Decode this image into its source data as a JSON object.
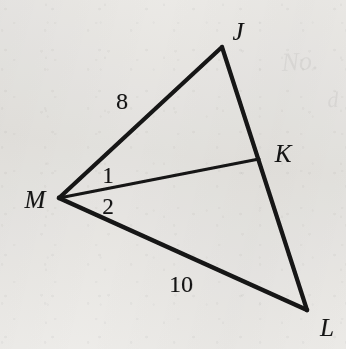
{
  "figure": {
    "background_color": "#f3f2f0",
    "ink_color": "#141414",
    "canvas": {
      "width": 346,
      "height": 349
    },
    "vertices": [
      {
        "id": "J",
        "label": "J",
        "point": [
          222,
          47
        ],
        "label_pos": [
          238,
          31
        ]
      },
      {
        "id": "M",
        "label": "M",
        "point": [
          59,
          198
        ],
        "label_pos": [
          35,
          199
        ]
      },
      {
        "id": "K",
        "label": "K",
        "point": [
          259,
          159
        ],
        "label_pos": [
          283,
          153
        ]
      },
      {
        "id": "L",
        "label": "L",
        "point": [
          307,
          310
        ],
        "label_pos": [
          327,
          327
        ]
      }
    ],
    "segments": [
      {
        "id": "MJ",
        "from": "M",
        "to": "J",
        "stroke_width": 4.2
      },
      {
        "id": "JL",
        "from": "J",
        "to": "L",
        "stroke_width": 4.2
      },
      {
        "id": "ML",
        "from": "M",
        "to": "L",
        "stroke_width": 4.6
      },
      {
        "id": "MK",
        "from": "M",
        "to": "K",
        "stroke_width": 3.0
      }
    ],
    "measure_labels": [
      {
        "id": "MJ-length",
        "text": "8",
        "pos": [
          122,
          101
        ],
        "on_segment": "MJ"
      },
      {
        "id": "ML-length",
        "text": "10",
        "pos": [
          181,
          284
        ],
        "on_segment": "ML"
      }
    ],
    "angle_labels": [
      {
        "id": "angle-1",
        "text": "1",
        "pos": [
          108,
          175
        ],
        "at_vertex": "M"
      },
      {
        "id": "angle-2",
        "text": "2",
        "pos": [
          108,
          206
        ],
        "at_vertex": "M"
      }
    ],
    "ghost_marks": [
      {
        "id": "ghost-upper-right",
        "text": "No.",
        "pos": [
          300,
          62
        ],
        "size": 26
      },
      {
        "id": "ghost-far-right",
        "text": "d",
        "pos": [
          333,
          100
        ],
        "size": 22
      }
    ]
  }
}
